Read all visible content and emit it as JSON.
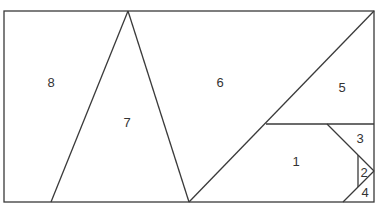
{
  "diagram": {
    "type": "dissection-puzzle",
    "stroke_color": "#3a3a3a",
    "background": "#ffffff",
    "outline": {
      "x1": 4,
      "y1": 11,
      "x2": 374,
      "y2": 202
    },
    "pieces": [
      {
        "id": "1",
        "label": "1",
        "lx": 296,
        "ly": 166
      },
      {
        "id": "2",
        "label": "2",
        "lx": 364,
        "ly": 176
      },
      {
        "id": "3",
        "label": "3",
        "lx": 360,
        "ly": 142
      },
      {
        "id": "4",
        "label": "4",
        "lx": 365,
        "ly": 197
      },
      {
        "id": "5",
        "label": "5",
        "lx": 342,
        "ly": 92
      },
      {
        "id": "6",
        "label": "6",
        "lx": 220,
        "ly": 87
      },
      {
        "id": "7",
        "label": "7",
        "lx": 127,
        "ly": 127
      },
      {
        "id": "8",
        "label": "8",
        "lx": 51,
        "ly": 87
      }
    ]
  }
}
